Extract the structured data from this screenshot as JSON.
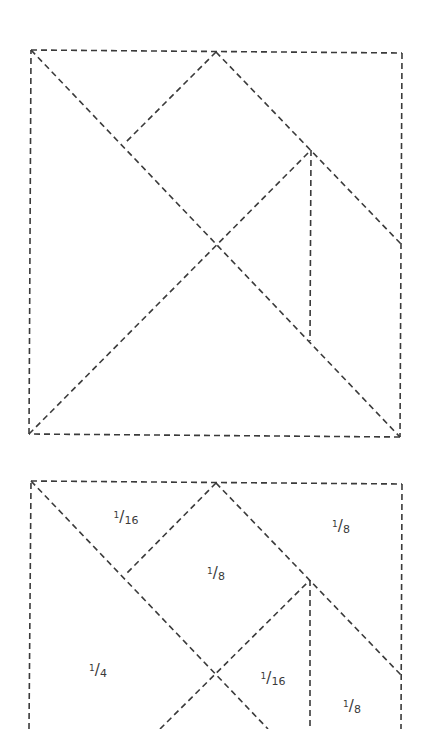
{
  "diagrams": [
    {
      "name": "tangram-outline",
      "lines": [
        {
          "x1": 31,
          "y1": 50,
          "x2": 402,
          "y2": 53
        },
        {
          "x1": 402,
          "y1": 53,
          "x2": 400,
          "y2": 437
        },
        {
          "x1": 400,
          "y1": 437,
          "x2": 29,
          "y2": 434
        },
        {
          "x1": 29,
          "y1": 434,
          "x2": 31,
          "y2": 50
        },
        {
          "x1": 31,
          "y1": 50,
          "x2": 400,
          "y2": 437
        },
        {
          "x1": 29,
          "y1": 434,
          "x2": 311,
          "y2": 150
        },
        {
          "x1": 216,
          "y1": 52,
          "x2": 401,
          "y2": 244
        },
        {
          "x1": 216,
          "y1": 52,
          "x2": 125,
          "y2": 143
        },
        {
          "x1": 311,
          "y1": 150,
          "x2": 310,
          "y2": 341
        }
      ]
    },
    {
      "name": "tangram-labeled",
      "lines": [
        {
          "x1": 31,
          "y1": 481,
          "x2": 402,
          "y2": 484
        },
        {
          "x1": 402,
          "y1": 484,
          "x2": 401,
          "y2": 729
        },
        {
          "x1": 29,
          "y1": 729,
          "x2": 31,
          "y2": 481
        },
        {
          "x1": 31,
          "y1": 481,
          "x2": 268,
          "y2": 729
        },
        {
          "x1": 160,
          "y1": 729,
          "x2": 310,
          "y2": 580
        },
        {
          "x1": 216,
          "y1": 483,
          "x2": 401,
          "y2": 675
        },
        {
          "x1": 216,
          "y1": 483,
          "x2": 125,
          "y2": 575
        },
        {
          "x1": 310,
          "y1": 580,
          "x2": 310,
          "y2": 729
        }
      ],
      "labels": [
        {
          "num": "1",
          "den": "16",
          "x": 126,
          "y": 517
        },
        {
          "num": "1",
          "den": "8",
          "x": 341,
          "y": 526
        },
        {
          "num": "1",
          "den": "8",
          "x": 216,
          "y": 573
        },
        {
          "num": "1",
          "den": "4",
          "x": 98,
          "y": 670
        },
        {
          "num": "1",
          "den": "16",
          "x": 273,
          "y": 678
        },
        {
          "num": "1",
          "den": "8",
          "x": 352,
          "y": 706
        }
      ]
    }
  ],
  "colors": {
    "line": "#3a3a3a",
    "background": "#ffffff"
  }
}
